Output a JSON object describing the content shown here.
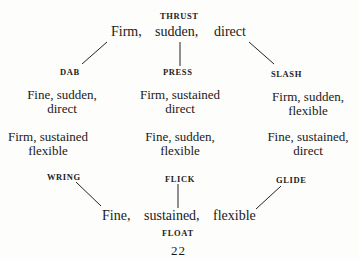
{
  "diagram": {
    "top_label": "THRUST",
    "top_row": {
      "left": "Firm,",
      "center": "sudden,",
      "right": "direct"
    },
    "corner_labels": {
      "top_left": "DAB",
      "top_center": "PRESS",
      "top_right": "SLASH"
    },
    "upper_blocks": {
      "left": {
        "line1": "Fine, sudden,",
        "line2": "direct"
      },
      "center": {
        "line1": "Firm, sustained",
        "line2": "direct"
      },
      "right": {
        "line1": "Firm, sudden,",
        "line2": "flexible"
      }
    },
    "lower_blocks": {
      "left": {
        "line1": "Firm, sustained",
        "line2": "flexible"
      },
      "center": {
        "line1": "Fine, sudden,",
        "line2": "flexible"
      },
      "right": {
        "line1": "Fine, sustained,",
        "line2": "direct"
      }
    },
    "bottom_labels": {
      "bottom_left": "WRING",
      "bottom_center": "FLICK",
      "bottom_right": "GLIDE"
    },
    "bottom_row": {
      "left": "Fine,",
      "center": "sustained,",
      "right": "flexible"
    },
    "bottom_label": "FLOAT",
    "page_number": "22"
  }
}
